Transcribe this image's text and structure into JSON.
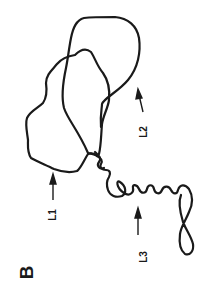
{
  "figure": {
    "panel_label": "B",
    "stroke_color": "#1a1a1a",
    "background_color": "#ffffff",
    "labels": [
      {
        "id": "L1",
        "text": "L1",
        "arrow": "up"
      },
      {
        "id": "L2",
        "text": "L2",
        "arrow": "up"
      },
      {
        "id": "L3",
        "text": "L3",
        "arrow": "up"
      }
    ]
  }
}
